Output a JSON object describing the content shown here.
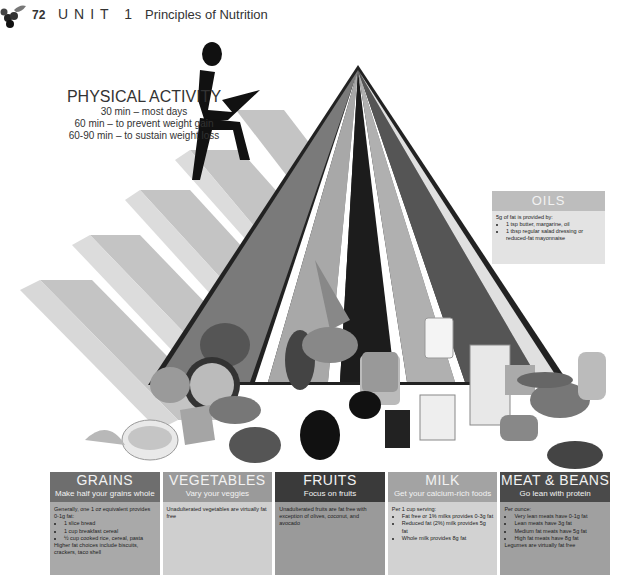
{
  "header": {
    "page_number": "72",
    "unit": "UNIT 1",
    "chapter_title": "Principles of Nutrition"
  },
  "activity": {
    "title": "PHYSICAL ACTIVITY",
    "lines": [
      "30 min – most days",
      "60 min – to prevent weight gain",
      "60-90 min – to sustain weight loss"
    ]
  },
  "illustration": {
    "food_labels": [
      "PEACHES",
      "RAISINS",
      "MILK",
      "MILK"
    ]
  },
  "oils": {
    "title": "OILS",
    "intro": "5g of fat is provided by:",
    "items": [
      "1 tsp butter, margarine, oil",
      "1 tbsp regular salad dressing or reduced-fat mayonnaise"
    ]
  },
  "groups": [
    {
      "name": "GRAINS",
      "tagline": "Make half your grains whole",
      "intro": "Generally, one 1 oz equivalent provides 0-1g fat:",
      "items": [
        "1 slice bread",
        "1 cup breakfast cereal",
        "½ cup cooked rice, cereal, pasta"
      ],
      "footer": "Higher fat choices include biscuits, crackers, taco shell"
    },
    {
      "name": "VEGETABLES",
      "tagline": "Vary your veggies",
      "intro": "Unadulterated vegetables are virtually fat free",
      "items": [],
      "footer": ""
    },
    {
      "name": "FRUITS",
      "tagline": "Focus on fruits",
      "intro": "Unadulterated fruits are fat free with exception of olives, coconut, and avocado",
      "items": [],
      "footer": ""
    },
    {
      "name": "MILK",
      "tagline": "Get your calcium-rich foods",
      "intro": "Per 1 cup serving:",
      "items": [
        "Fat free or 1% milks provides 0-3g fat",
        "Reduced fat (2%) milk provides 5g fat",
        "Whole milk provides 8g fat"
      ],
      "footer": ""
    },
    {
      "name": "MEAT & BEANS",
      "tagline": "Go lean with protein",
      "intro": "Per ounce:",
      "items": [
        "Very lean meats have 0-1g fat",
        "Lean meats have 3g fat",
        "Medium fat meats have 5g fat",
        "High fat meats have 8g fat"
      ],
      "footer": "Legumes are virtually fat free"
    }
  ]
}
